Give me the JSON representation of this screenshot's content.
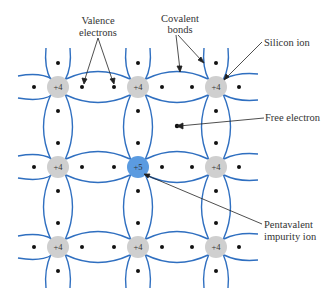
{
  "diagram": {
    "colors": {
      "bond": "#2f6fc0",
      "silicon_ion": "#cfcfcf",
      "impurity_ion": "#5b9be0",
      "electron": "#111111",
      "arrow": "#222222"
    },
    "ions": [
      {
        "row": 0,
        "col": 0,
        "label": "+4",
        "type": "silicon"
      },
      {
        "row": 0,
        "col": 1,
        "label": "+4",
        "type": "silicon"
      },
      {
        "row": 0,
        "col": 2,
        "label": "+4",
        "type": "silicon"
      },
      {
        "row": 1,
        "col": 0,
        "label": "+4",
        "type": "silicon"
      },
      {
        "row": 1,
        "col": 1,
        "label": "+5",
        "type": "impurity"
      },
      {
        "row": 1,
        "col": 2,
        "label": "+4",
        "type": "silicon"
      },
      {
        "row": 2,
        "col": 0,
        "label": "+4",
        "type": "silicon"
      },
      {
        "row": 2,
        "col": 1,
        "label": "+4",
        "type": "silicon"
      },
      {
        "row": 2,
        "col": 2,
        "label": "+4",
        "type": "silicon"
      }
    ],
    "labels": {
      "valence_1": "Valence",
      "valence_2": "electrons",
      "covalent_1": "Covalent",
      "covalent_2": "bonds",
      "silicon_ion": "Silicon ion",
      "free_electron": "Free electron",
      "pentavalent_1": "Pentavalent",
      "pentavalent_2": "impurity ion"
    }
  }
}
